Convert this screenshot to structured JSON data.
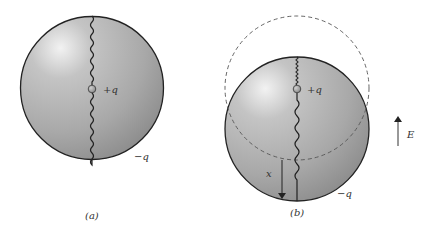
{
  "panels": [
    {
      "id": "a",
      "caption": "(a)",
      "inner_charge": "+q",
      "outer_charge": "−q"
    },
    {
      "id": "b",
      "caption": "(b)",
      "inner_charge": "+q",
      "outer_charge": "−q",
      "displacement_label": "x"
    }
  ],
  "field": {
    "label": "E",
    "direction": "up"
  },
  "colors": {
    "sphere_fill": "#a9a9a9",
    "sphere_highlight": "#eeeeee",
    "outline": "#222222",
    "dashed": "#555555"
  }
}
